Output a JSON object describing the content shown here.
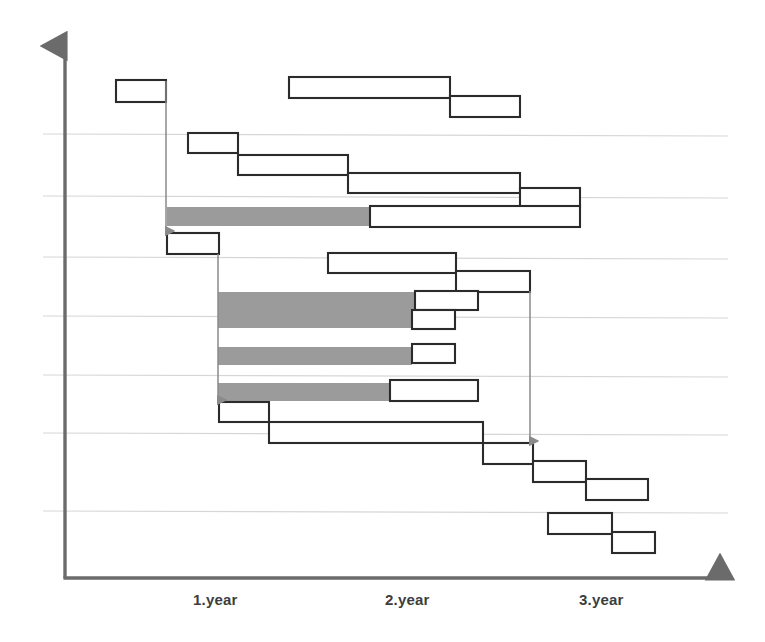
{
  "chart_data": {
    "type": "bar",
    "chart_kind": "gantt",
    "title": "",
    "xlabel": "",
    "ylabel": "",
    "xlim": [
      0,
      3.4
    ],
    "ylim": [
      0,
      15
    ],
    "grid": true,
    "legend": false,
    "axis_style": {
      "x_axis_arrow": true,
      "y_axis_arrow": true,
      "axis_color": "#6b6b6b",
      "gridline_color": "#d6d6d6"
    },
    "colors": {
      "bar_fill": "#ffffff",
      "bar_stroke": "#2b2b2b",
      "critical_fill": "#9b9b9b",
      "critical_stroke": "#9b9b9b",
      "axis": "#6b6b6b",
      "grid": "#d6d6d6",
      "connector": "#8a8a8a",
      "label_text": "#3d3d3d"
    },
    "x_tick_labels": [
      "1.year",
      "2.year",
      "3.year"
    ],
    "x_tick_positions_px": [
      193,
      385,
      579
    ],
    "gridline_y_px": [
      134,
      196,
      257,
      316,
      375,
      433,
      511
    ],
    "tasks": [
      {
        "id": "t1",
        "start_px": 116,
        "end_px": 166,
        "top_px": 80,
        "height_px": 22,
        "style": "outline"
      },
      {
        "id": "t2",
        "start_px": 289,
        "end_px": 450,
        "top_px": 77,
        "height_px": 21,
        "style": "outline"
      },
      {
        "id": "t3",
        "start_px": 450,
        "end_px": 520,
        "top_px": 96,
        "height_px": 21,
        "style": "outline"
      },
      {
        "id": "t4",
        "start_px": 188,
        "end_px": 238,
        "top_px": 133,
        "height_px": 20,
        "style": "outline"
      },
      {
        "id": "t5",
        "start_px": 238,
        "end_px": 348,
        "top_px": 155,
        "height_px": 20,
        "style": "outline"
      },
      {
        "id": "t6",
        "start_px": 348,
        "end_px": 520,
        "top_px": 173,
        "height_px": 20,
        "style": "outline"
      },
      {
        "id": "t7",
        "start_px": 520,
        "end_px": 580,
        "top_px": 188,
        "height_px": 20,
        "style": "outline"
      },
      {
        "id": "t8",
        "start_px": 167,
        "end_px": 370,
        "top_px": 207,
        "height_px": 19,
        "style": "critical"
      },
      {
        "id": "t9",
        "start_px": 370,
        "end_px": 580,
        "top_px": 206,
        "height_px": 21,
        "style": "outline"
      },
      {
        "id": "t10",
        "start_px": 167,
        "end_px": 219,
        "top_px": 233,
        "height_px": 21,
        "style": "outline"
      },
      {
        "id": "t11",
        "start_px": 328,
        "end_px": 456,
        "top_px": 253,
        "height_px": 20,
        "style": "outline"
      },
      {
        "id": "t12",
        "start_px": 456,
        "end_px": 530,
        "top_px": 271,
        "height_px": 21,
        "style": "outline"
      },
      {
        "id": "t13",
        "start_px": 218,
        "end_px": 415,
        "top_px": 292,
        "height_px": 36,
        "style": "critical"
      },
      {
        "id": "t14",
        "start_px": 415,
        "end_px": 478,
        "top_px": 291,
        "height_px": 19,
        "style": "outline"
      },
      {
        "id": "t15",
        "start_px": 412,
        "end_px": 455,
        "top_px": 310,
        "height_px": 19,
        "style": "outline"
      },
      {
        "id": "t16",
        "start_px": 218,
        "end_px": 412,
        "top_px": 347,
        "height_px": 18,
        "style": "critical"
      },
      {
        "id": "t17",
        "start_px": 412,
        "end_px": 455,
        "top_px": 344,
        "height_px": 19,
        "style": "outline"
      },
      {
        "id": "t18",
        "start_px": 218,
        "end_px": 390,
        "top_px": 383,
        "height_px": 18,
        "style": "critical"
      },
      {
        "id": "t19",
        "start_px": 390,
        "end_px": 478,
        "top_px": 380,
        "height_px": 21,
        "style": "outline"
      },
      {
        "id": "t20",
        "start_px": 219,
        "end_px": 269,
        "top_px": 402,
        "height_px": 20,
        "style": "outline"
      },
      {
        "id": "t21",
        "start_px": 269,
        "end_px": 483,
        "top_px": 422,
        "height_px": 21,
        "style": "outline"
      },
      {
        "id": "t22",
        "start_px": 483,
        "end_px": 533,
        "top_px": 443,
        "height_px": 21,
        "style": "outline"
      },
      {
        "id": "t23",
        "start_px": 533,
        "end_px": 586,
        "top_px": 461,
        "height_px": 21,
        "style": "outline"
      },
      {
        "id": "t24",
        "start_px": 586,
        "end_px": 648,
        "top_px": 479,
        "height_px": 21,
        "style": "outline"
      },
      {
        "id": "t25",
        "start_px": 548,
        "end_px": 612,
        "top_px": 513,
        "height_px": 21,
        "style": "outline"
      },
      {
        "id": "t26",
        "start_px": 612,
        "end_px": 655,
        "top_px": 532,
        "height_px": 21,
        "style": "outline"
      }
    ],
    "dependency_arrows": [
      {
        "id": "a1",
        "x_px": 166,
        "from_y_px": 81,
        "to_y_px": 231
      },
      {
        "id": "a2",
        "x_px": 218,
        "from_y_px": 254,
        "to_y_px": 400
      },
      {
        "id": "a3",
        "x_px": 530,
        "from_y_px": 291,
        "to_y_px": 441
      }
    ],
    "axes_px": {
      "origin_x": 65,
      "origin_y": 578,
      "y_axis_top": 38,
      "x_axis_right": 728
    }
  }
}
